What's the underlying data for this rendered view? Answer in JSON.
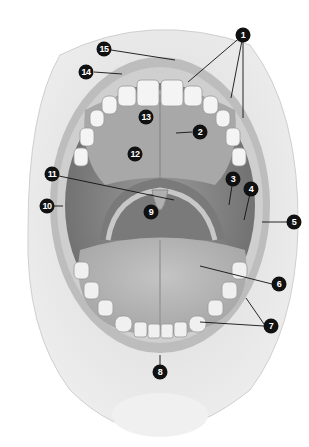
{
  "diagram": {
    "labels": [
      {
        "num": "1",
        "x": 243,
        "y": 35
      },
      {
        "num": "2",
        "x": 200,
        "y": 132
      },
      {
        "num": "3",
        "x": 233,
        "y": 179
      },
      {
        "num": "4",
        "x": 251,
        "y": 189
      },
      {
        "num": "5",
        "x": 294,
        "y": 222
      },
      {
        "num": "6",
        "x": 279,
        "y": 284
      },
      {
        "num": "7",
        "x": 271,
        "y": 326
      },
      {
        "num": "8",
        "x": 160,
        "y": 372
      },
      {
        "num": "9",
        "x": 151,
        "y": 212
      },
      {
        "num": "10",
        "x": 47,
        "y": 206
      },
      {
        "num": "11",
        "x": 52,
        "y": 174
      },
      {
        "num": "12",
        "x": 135,
        "y": 154
      },
      {
        "num": "13",
        "x": 146,
        "y": 117
      },
      {
        "num": "14",
        "x": 86,
        "y": 72
      },
      {
        "num": "15",
        "x": 104,
        "y": 49
      }
    ]
  }
}
